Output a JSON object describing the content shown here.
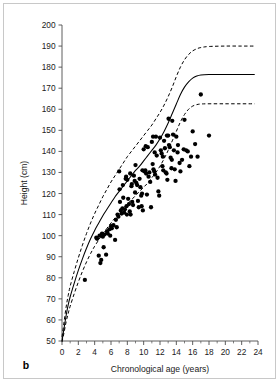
{
  "figure": {
    "panel_label": "b"
  },
  "chart_data": {
    "type": "scatter",
    "title": "",
    "xlabel": "Chronological age (years)",
    "ylabel": "Height (cm)",
    "xlim": [
      0,
      24
    ],
    "ylim": [
      50,
      200
    ],
    "grid": false,
    "legend_position": "none",
    "x_ticks": [
      0,
      2,
      4,
      6,
      8,
      10,
      12,
      14,
      16,
      18,
      20,
      22,
      24
    ],
    "x_tick_labels": [
      "0",
      "2",
      "4",
      "6",
      "8",
      "10",
      "12",
      "14",
      "16",
      "18",
      "20",
      "22",
      "24"
    ],
    "x_minor_ticks": [
      1,
      3,
      5,
      7,
      9,
      11,
      13,
      15,
      17,
      19,
      21,
      23
    ],
    "y_ticks": [
      50,
      60,
      70,
      80,
      90,
      100,
      110,
      120,
      130,
      140,
      150,
      160,
      170,
      180,
      190,
      200
    ],
    "y_tick_labels": [
      "50",
      "60",
      "70",
      "80",
      "90",
      "100",
      "110",
      "120",
      "130",
      "140",
      "150",
      "160",
      "170",
      "180",
      "190",
      "200"
    ],
    "series": [
      {
        "name": "upper reference percentile",
        "type": "line",
        "style": "dashed",
        "color": "#000000",
        "points": [
          [
            0.0,
            52.0
          ],
          [
            0.25,
            59.0
          ],
          [
            0.5,
            66.0
          ],
          [
            0.75,
            71.5
          ],
          [
            1.0,
            76.0
          ],
          [
            1.5,
            83.0
          ],
          [
            2.0,
            89.5
          ],
          [
            2.5,
            95.5
          ],
          [
            3.0,
            101.0
          ],
          [
            3.5,
            106.0
          ],
          [
            4.0,
            110.5
          ],
          [
            4.5,
            114.5
          ],
          [
            5.0,
            118.5
          ],
          [
            5.5,
            122.0
          ],
          [
            6.0,
            125.5
          ],
          [
            6.5,
            128.5
          ],
          [
            7.0,
            131.5
          ],
          [
            7.5,
            134.5
          ],
          [
            8.0,
            137.5
          ],
          [
            8.5,
            140.0
          ],
          [
            9.0,
            142.5
          ],
          [
            9.5,
            145.0
          ],
          [
            10.0,
            147.5
          ],
          [
            10.5,
            150.0
          ],
          [
            11.0,
            152.5
          ],
          [
            11.5,
            155.5
          ],
          [
            12.0,
            158.5
          ],
          [
            12.5,
            162.0
          ],
          [
            13.0,
            166.0
          ],
          [
            13.5,
            170.5
          ],
          [
            14.0,
            175.5
          ],
          [
            14.5,
            180.0
          ],
          [
            15.0,
            183.5
          ],
          [
            15.5,
            186.0
          ],
          [
            16.0,
            187.7
          ],
          [
            16.5,
            188.7
          ],
          [
            17.0,
            189.3
          ],
          [
            18.0,
            189.8
          ],
          [
            20.0,
            190.0
          ],
          [
            22.0,
            190.0
          ],
          [
            23.6,
            190.0
          ]
        ]
      },
      {
        "name": "median reference",
        "type": "line",
        "style": "solid",
        "color": "#000000",
        "points": [
          [
            0.0,
            50.0
          ],
          [
            0.25,
            56.0
          ],
          [
            0.5,
            62.0
          ],
          [
            0.75,
            67.0
          ],
          [
            1.0,
            71.0
          ],
          [
            1.5,
            77.5
          ],
          [
            2.0,
            83.5
          ],
          [
            2.5,
            89.0
          ],
          [
            3.0,
            94.0
          ],
          [
            3.5,
            98.5
          ],
          [
            4.0,
            102.5
          ],
          [
            4.5,
            106.0
          ],
          [
            5.0,
            109.5
          ],
          [
            5.5,
            112.5
          ],
          [
            6.0,
            115.5
          ],
          [
            6.5,
            118.5
          ],
          [
            7.0,
            121.0
          ],
          [
            7.5,
            123.5
          ],
          [
            8.0,
            126.0
          ],
          [
            8.5,
            128.5
          ],
          [
            9.0,
            131.0
          ],
          [
            9.5,
            133.0
          ],
          [
            10.0,
            135.5
          ],
          [
            10.5,
            138.0
          ],
          [
            11.0,
            140.5
          ],
          [
            11.5,
            143.0
          ],
          [
            12.0,
            146.0
          ],
          [
            12.5,
            149.5
          ],
          [
            13.0,
            153.5
          ],
          [
            13.5,
            158.0
          ],
          [
            14.0,
            162.5
          ],
          [
            14.5,
            167.0
          ],
          [
            15.0,
            170.5
          ],
          [
            15.5,
            173.0
          ],
          [
            16.0,
            174.8
          ],
          [
            16.5,
            175.8
          ],
          [
            17.0,
            176.3
          ],
          [
            18.0,
            176.5
          ],
          [
            20.0,
            176.5
          ],
          [
            22.0,
            176.5
          ],
          [
            23.6,
            176.5
          ]
        ]
      },
      {
        "name": "lower reference percentile",
        "type": "line",
        "style": "dashed",
        "color": "#000000",
        "points": [
          [
            0.0,
            49.5
          ],
          [
            0.25,
            54.0
          ],
          [
            0.5,
            59.0
          ],
          [
            0.75,
            63.0
          ],
          [
            1.0,
            66.5
          ],
          [
            1.5,
            72.5
          ],
          [
            2.0,
            78.0
          ],
          [
            2.5,
            83.0
          ],
          [
            3.0,
            87.5
          ],
          [
            3.5,
            91.5
          ],
          [
            4.0,
            95.0
          ],
          [
            4.5,
            98.0
          ],
          [
            5.0,
            101.0
          ],
          [
            5.5,
            103.5
          ],
          [
            6.0,
            106.0
          ],
          [
            6.5,
            108.5
          ],
          [
            7.0,
            111.0
          ],
          [
            7.5,
            113.0
          ],
          [
            8.0,
            115.0
          ],
          [
            8.5,
            117.0
          ],
          [
            9.0,
            119.0
          ],
          [
            9.5,
            121.0
          ],
          [
            10.0,
            123.0
          ],
          [
            10.5,
            125.0
          ],
          [
            11.0,
            127.5
          ],
          [
            11.5,
            130.0
          ],
          [
            12.0,
            133.0
          ],
          [
            12.5,
            136.5
          ],
          [
            13.0,
            140.5
          ],
          [
            13.5,
            145.0
          ],
          [
            14.0,
            149.5
          ],
          [
            14.5,
            154.0
          ],
          [
            15.0,
            157.5
          ],
          [
            15.5,
            160.0
          ],
          [
            16.0,
            161.5
          ],
          [
            16.5,
            162.2
          ],
          [
            17.0,
            162.5
          ],
          [
            18.0,
            162.6
          ],
          [
            20.0,
            162.6
          ],
          [
            22.0,
            162.6
          ],
          [
            23.6,
            162.6
          ]
        ]
      },
      {
        "name": "patient measurements",
        "type": "scatter",
        "marker": "filled-circle",
        "color": "#000000",
        "points": [
          [
            2.8,
            79.0
          ],
          [
            4.2,
            99.0
          ],
          [
            4.3,
            98.5
          ],
          [
            4.5,
            90.5
          ],
          [
            4.6,
            100.0
          ],
          [
            4.7,
            87.0
          ],
          [
            4.8,
            88.5
          ],
          [
            4.9,
            101.0
          ],
          [
            5.0,
            99.5
          ],
          [
            5.1,
            94.5
          ],
          [
            5.2,
            100.5
          ],
          [
            5.4,
            91.0
          ],
          [
            5.5,
            102.0
          ],
          [
            5.6,
            101.0
          ],
          [
            5.8,
            103.0
          ],
          [
            5.9,
            100.0
          ],
          [
            6.0,
            104.5
          ],
          [
            6.1,
            103.5
          ],
          [
            6.3,
            105.0
          ],
          [
            6.5,
            98.0
          ],
          [
            6.6,
            107.5
          ],
          [
            6.8,
            110.0
          ],
          [
            6.9,
            109.0
          ],
          [
            7.0,
            130.5
          ],
          [
            7.05,
            122.0
          ],
          [
            7.1,
            116.0
          ],
          [
            7.2,
            112.0
          ],
          [
            7.3,
            110.5
          ],
          [
            7.4,
            113.0
          ],
          [
            7.5,
            118.0
          ],
          [
            7.6,
            111.0
          ],
          [
            7.7,
            112.5
          ],
          [
            7.8,
            127.0
          ],
          [
            7.85,
            128.0
          ],
          [
            7.9,
            114.0
          ],
          [
            7.95,
            110.0
          ],
          [
            8.0,
            126.5
          ],
          [
            8.1,
            117.5
          ],
          [
            8.2,
            115.0
          ],
          [
            8.3,
            111.5
          ],
          [
            8.4,
            110.0
          ],
          [
            8.5,
            123.5
          ],
          [
            8.55,
            124.5
          ],
          [
            8.6,
            116.0
          ],
          [
            8.7,
            114.5
          ],
          [
            8.8,
            128.5
          ],
          [
            8.9,
            126.0
          ],
          [
            8.95,
            120.5
          ],
          [
            9.0,
            133.5
          ],
          [
            9.1,
            125.0
          ],
          [
            9.2,
            124.0
          ],
          [
            9.3,
            116.5
          ],
          [
            9.4,
            113.5
          ],
          [
            9.5,
            127.0
          ],
          [
            9.6,
            123.0
          ],
          [
            9.7,
            119.0
          ],
          [
            9.75,
            114.0
          ],
          [
            9.8,
            120.0
          ],
          [
            9.9,
            112.0
          ],
          [
            10.0,
            141.0
          ],
          [
            10.1,
            130.5
          ],
          [
            10.2,
            131.0
          ],
          [
            10.3,
            129.5
          ],
          [
            10.4,
            119.5
          ],
          [
            10.5,
            142.0
          ],
          [
            10.6,
            128.0
          ],
          [
            10.7,
            130.0
          ],
          [
            10.8,
            125.5
          ],
          [
            10.9,
            113.5
          ],
          [
            11.0,
            144.5
          ],
          [
            11.1,
            134.0
          ],
          [
            11.2,
            131.5
          ],
          [
            11.3,
            130.5
          ],
          [
            11.4,
            129.0
          ],
          [
            11.5,
            147.0
          ],
          [
            11.6,
            138.0
          ],
          [
            11.7,
            127.5
          ],
          [
            11.8,
            121.0
          ],
          [
            11.9,
            119.0
          ],
          [
            12.0,
            146.5
          ],
          [
            12.1,
            140.5
          ],
          [
            12.2,
            139.0
          ],
          [
            12.3,
            133.0
          ],
          [
            12.4,
            131.0
          ],
          [
            12.5,
            145.0
          ],
          [
            12.6,
            141.5
          ],
          [
            12.7,
            130.0
          ],
          [
            12.8,
            129.5
          ],
          [
            12.9,
            126.5
          ],
          [
            13.0,
            147.5
          ],
          [
            13.1,
            143.0
          ],
          [
            13.2,
            142.0
          ],
          [
            13.3,
            137.0
          ],
          [
            13.4,
            132.0
          ],
          [
            13.5,
            154.5
          ],
          [
            13.6,
            148.0
          ],
          [
            13.7,
            140.5
          ],
          [
            13.8,
            131.5
          ],
          [
            13.9,
            126.0
          ],
          [
            14.0,
            147.0
          ],
          [
            14.2,
            143.0
          ],
          [
            14.4,
            134.5
          ],
          [
            14.5,
            130.5
          ],
          [
            14.7,
            136.0
          ],
          [
            14.9,
            141.0
          ],
          [
            15.0,
            155.0
          ],
          [
            15.2,
            140.5
          ],
          [
            15.4,
            140.0
          ],
          [
            15.6,
            133.0
          ],
          [
            15.8,
            137.5
          ],
          [
            16.0,
            149.5
          ],
          [
            16.3,
            143.5
          ],
          [
            16.6,
            137.5
          ],
          [
            17.0,
            167.0
          ],
          [
            18.0,
            147.5
          ],
          [
            11.15,
            147.0
          ],
          [
            13.05,
            155.5
          ],
          [
            12.85,
            147.5
          ],
          [
            10.25,
            142.5
          ],
          [
            9.85,
            131.0
          ],
          [
            8.35,
            129.5
          ],
          [
            7.45,
            124.0
          ],
          [
            6.7,
            104.0
          ],
          [
            11.35,
            139.5
          ],
          [
            12.35,
            137.5
          ],
          [
            13.45,
            136.0
          ],
          [
            14.15,
            139.5
          ]
        ]
      }
    ]
  }
}
